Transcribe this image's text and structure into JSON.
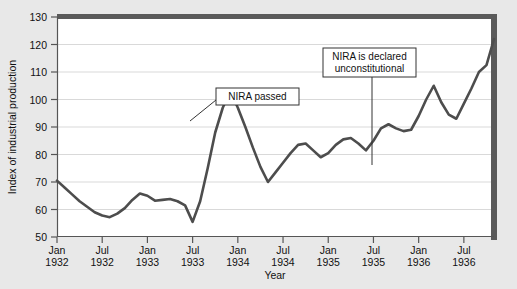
{
  "chart_data": {
    "type": "line",
    "title": "",
    "subtitle": "",
    "xlabel": "Year",
    "ylabel": "Index of industrial production",
    "ylim": [
      50,
      130
    ],
    "ytick_step": 10,
    "yticks": [
      50,
      60,
      70,
      80,
      90,
      100,
      110,
      120,
      130
    ],
    "grid": true,
    "grid_axis": "y",
    "legend": "none",
    "xtick_labels": [
      {
        "month": "Jan",
        "year": "1932"
      },
      {
        "month": "Jul",
        "year": "1932"
      },
      {
        "month": "Jan",
        "year": "1933"
      },
      {
        "month": "Jul",
        "year": "1933"
      },
      {
        "month": "Jan",
        "year": "1934"
      },
      {
        "month": "Jul",
        "year": "1934"
      },
      {
        "month": "Jan",
        "year": "1935"
      },
      {
        "month": "Jul",
        "year": "1935"
      },
      {
        "month": "Jan",
        "year": "1936"
      },
      {
        "month": "Jul",
        "year": "1936"
      }
    ],
    "x_start_month_index": 0,
    "x_end_month_index": 58,
    "series": [
      {
        "name": "Index of industrial production",
        "color": "#4d4d4d",
        "x": [
          "Jan 1932",
          "Feb 1932",
          "Mar 1932",
          "Apr 1932",
          "May 1932",
          "Jun 1932",
          "Jul 1932",
          "Aug 1932",
          "Sep 1932",
          "Oct 1932",
          "Nov 1932",
          "Dec 1932",
          "Jan 1933",
          "Feb 1933",
          "Mar 1933",
          "Apr 1933",
          "May 1933",
          "Jun 1933",
          "Jul 1933",
          "Aug 1933",
          "Sep 1933",
          "Oct 1933",
          "Nov 1933",
          "Dec 1933",
          "Jan 1934",
          "Feb 1934",
          "Mar 1934",
          "Apr 1934",
          "May 1934",
          "Jun 1934",
          "Jul 1934",
          "Aug 1934",
          "Sep 1934",
          "Oct 1934",
          "Nov 1934",
          "Dec 1934",
          "Jan 1935",
          "Feb 1935",
          "Mar 1935",
          "Apr 1935",
          "May 1935",
          "Jun 1935",
          "Jul 1935",
          "Aug 1935",
          "Sep 1935",
          "Oct 1935",
          "Nov 1935",
          "Dec 1935",
          "Jan 1936",
          "Feb 1936",
          "Mar 1936",
          "Apr 1936",
          "May 1936",
          "Jun 1936",
          "Jul 1936",
          "Aug 1936",
          "Sep 1936",
          "Oct 1936",
          "Nov 1936"
        ],
        "values": [
          70.5,
          68.0,
          65.5,
          63.0,
          61.0,
          59.0,
          57.8,
          57.2,
          58.5,
          60.5,
          63.5,
          65.8,
          65.0,
          63.2,
          63.5,
          63.8,
          63.0,
          61.5,
          55.5,
          63.0,
          75.0,
          88.0,
          97.0,
          103.0,
          97.0,
          90.0,
          82.5,
          75.5,
          70.0,
          73.5,
          77.0,
          80.5,
          83.5,
          84.0,
          81.5,
          79.0,
          80.5,
          83.5,
          85.5,
          86.0,
          84.0,
          81.5,
          85.0,
          89.5,
          91.0,
          89.5,
          88.5,
          89.0,
          94.0,
          100.0,
          105.0,
          99.0,
          94.5,
          93.0,
          98.5,
          104.0,
          110.0,
          112.5,
          122.0
        ]
      }
    ],
    "annotations": [
      {
        "id": "nira-passed",
        "text_lines": [
          "NIRA passed"
        ],
        "box": {
          "x": 216,
          "y": 88,
          "width": 83,
          "height": 17
        },
        "leader_from": {
          "x": 216,
          "y": 100
        },
        "leader_to": {
          "x": 190,
          "y": 121
        }
      },
      {
        "id": "nira-unconstitutional",
        "text_lines": [
          "NIRA is declared",
          "unconstitutional"
        ],
        "box": {
          "x": 323,
          "y": 48,
          "width": 93,
          "height": 29
        },
        "leader_from": {
          "x": 372,
          "y": 77
        },
        "leader_to": {
          "x": 372,
          "y": 165
        }
      }
    ]
  },
  "colors": {
    "page_background": "#e8e8e8",
    "plot_background": "#ffffff",
    "line": "#4d4d4d",
    "grid": "#d9d9d9",
    "axis": "#555555",
    "frame_dark": "#5a5a5a",
    "text": "#111111"
  }
}
